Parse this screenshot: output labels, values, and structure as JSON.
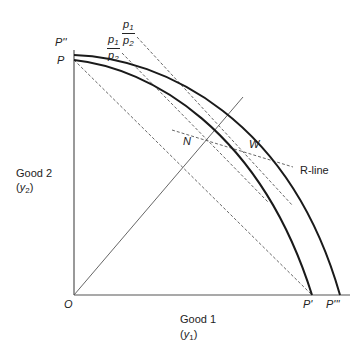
{
  "diagram": {
    "type": "production-possibility-frontier",
    "axes": {
      "x_label": "Good 1",
      "x_var": "y",
      "x_var_sub": "1",
      "y_label": "Good 2",
      "y_var": "y",
      "y_var_sub": "2",
      "origin_label": "O"
    },
    "points": {
      "P": "P",
      "P_dbl": "P''",
      "P_prime": "P'",
      "P_triple": "P'''",
      "N": "N",
      "W": "W"
    },
    "price_ratios": [
      {
        "numerator": "p",
        "numerator_sub": "1",
        "denominator": "p",
        "denominator_sub": "2",
        "position": "outer"
      },
      {
        "numerator": "p",
        "numerator_sub": "1",
        "denominator": "p",
        "denominator_sub": "2",
        "position": "inner"
      }
    ],
    "r_line_label": "R-line",
    "curves": [
      {
        "name": "inner-ppf",
        "from": "P",
        "to": "P'"
      },
      {
        "name": "outer-ppf",
        "from": "P''",
        "to": "P'''"
      }
    ],
    "colors": {
      "line": "#1a1a1a",
      "dashed": "#555555",
      "background": "#ffffff"
    }
  }
}
